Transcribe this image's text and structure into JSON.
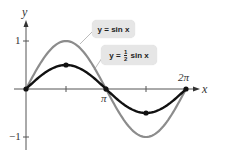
{
  "chart_data": {
    "type": "line",
    "title": "",
    "xlabel": "x",
    "ylabel": "y",
    "xlim": [
      0,
      6.2832
    ],
    "ylim": [
      -1,
      1
    ],
    "x_ticks": [
      "π/2",
      "π",
      "3π/2",
      "2π"
    ],
    "x_tick_labels": [
      "π",
      "2π"
    ],
    "y_tick_labels": [
      "1",
      "−1"
    ],
    "grid": false,
    "series": [
      {
        "name": "y = sin x",
        "color": "#8c8c8c",
        "x": [
          0,
          0.7854,
          1.5708,
          2.3562,
          3.1416,
          3.927,
          4.7124,
          5.4978,
          6.2832
        ],
        "values": [
          0,
          0.707,
          1,
          0.707,
          0,
          -0.707,
          -1,
          -0.707,
          0
        ]
      },
      {
        "name": "y = ½ sin x",
        "color": "#111111",
        "x": [
          0,
          0.7854,
          1.5708,
          2.3562,
          3.1416,
          3.927,
          4.7124,
          5.4978,
          6.2832
        ],
        "values": [
          0,
          0.354,
          0.5,
          0.354,
          0,
          -0.354,
          -0.5,
          -0.354,
          0
        ],
        "marked_points": [
          [
            0,
            0
          ],
          [
            1.5708,
            0.5
          ],
          [
            3.1416,
            0
          ],
          [
            4.7124,
            -0.5
          ],
          [
            6.2832,
            0
          ]
        ]
      }
    ],
    "annotations": [
      {
        "text": "y = sin x",
        "target_series": 0
      },
      {
        "text": "y = ½ sin x",
        "target_series": 1
      }
    ]
  },
  "labels": {
    "y_axis": "y",
    "x_axis": "x",
    "y_one": "1",
    "y_neg_one": "−1",
    "pi": "π",
    "two_pi": "2π",
    "sin_label": "y = sin x",
    "half_sin_prefix": "y = ",
    "half_sin_num": "1",
    "half_sin_den": "2",
    "half_sin_suffix": " sin x"
  }
}
